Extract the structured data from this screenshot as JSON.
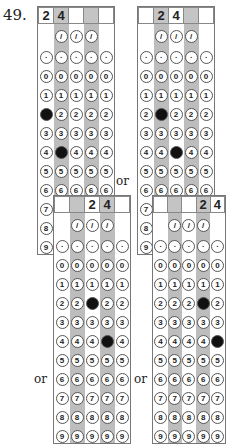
{
  "question_number": "49.",
  "connector_label": "or",
  "colors": {
    "shaded_column": "#c4c4c4",
    "filled_bubble": "#111111",
    "border": "#777777"
  },
  "bubble_rows": [
    "/",
    ".",
    "0",
    "1",
    "2",
    "3",
    "4",
    "5",
    "6",
    "7",
    "8",
    "9"
  ],
  "grids": [
    {
      "answer_boxes": [
        "2",
        "4",
        "",
        "",
        ""
      ],
      "filled": [
        {
          "col": 0,
          "digit": "2"
        },
        {
          "col": 1,
          "digit": "4"
        }
      ],
      "shaded_cols": [
        1,
        3
      ]
    },
    {
      "answer_boxes": [
        "",
        "2",
        "4",
        "",
        ""
      ],
      "filled": [
        {
          "col": 1,
          "digit": "2"
        },
        {
          "col": 2,
          "digit": "4"
        }
      ],
      "shaded_cols": [
        1,
        3
      ]
    },
    {
      "answer_boxes": [
        "",
        "",
        "2",
        "4",
        ""
      ],
      "filled": [
        {
          "col": 2,
          "digit": "2"
        },
        {
          "col": 3,
          "digit": "4"
        }
      ],
      "shaded_cols": [
        1,
        3
      ]
    },
    {
      "answer_boxes": [
        "",
        "",
        "",
        "2",
        "4"
      ],
      "filled": [
        {
          "col": 3,
          "digit": "2"
        },
        {
          "col": 4,
          "digit": "4"
        }
      ],
      "shaded_cols": [
        1,
        3
      ]
    }
  ]
}
